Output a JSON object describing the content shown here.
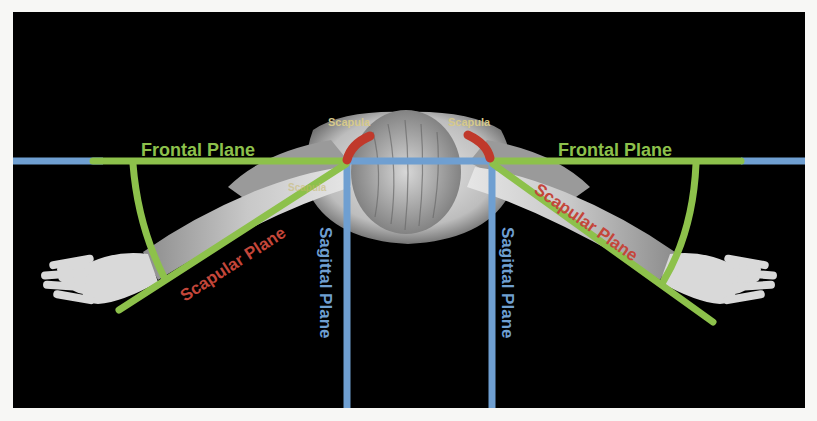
{
  "figure": {
    "background": "#000000",
    "colors": {
      "frontal_plane": "#8dc14b",
      "scapular_plane_line": "#8dc14b",
      "sagittal_plane": "#6f9fd1",
      "scapula": "#c0392b",
      "scapula_label": "#d6c98a",
      "scapular_plane_label": "#c4463a",
      "frontal_plane_label": "#8dc14b",
      "sagittal_plane_label": "#6f9fd1"
    }
  },
  "labels": {
    "frontal_left": "Frontal Plane",
    "frontal_right": "Frontal Plane",
    "scapular_left": "Scapular Plane",
    "scapular_right": "Scapular Plane",
    "sagittal_left": "Sagittal Plane",
    "sagittal_right": "Sagittal Plane",
    "scapula_left": "Scapula",
    "scapula_right": "Scapula",
    "scapula_faint": "Scapula"
  }
}
